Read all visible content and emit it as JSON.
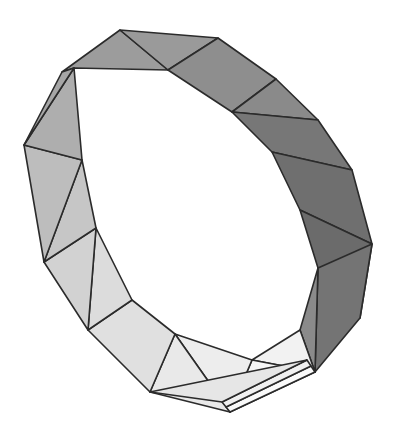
{
  "figure": {
    "name": "triangulated-polygonal-band",
    "description": "Shaded 3D polygonal annulus (Mobius-like band) built from triangular faces",
    "background_color": "#ffffff",
    "edge_color": "#2b2b2b",
    "edge_width": 1.6,
    "canvas": {
      "width": 406,
      "height": 444
    },
    "palette": {
      "dark": "#6f6f6f",
      "mid_dark": "#8c8c8c",
      "mid": "#9c9c9c",
      "mid_light": "#b5b5b5",
      "light": "#d6d6d6",
      "lighter": "#e8e8e8",
      "lightest": "#f4f4f4",
      "white": "#fbfbfb"
    },
    "outer_ring_vertices": [
      [
        120,
        30
      ],
      [
        218,
        38
      ],
      [
        276,
        79
      ],
      [
        318,
        120
      ],
      [
        352,
        170
      ],
      [
        372,
        244
      ],
      [
        360,
        318
      ],
      [
        315,
        372
      ],
      [
        230,
        412
      ],
      [
        150,
        392
      ],
      [
        88,
        330
      ],
      [
        44,
        262
      ],
      [
        24,
        145
      ],
      [
        62,
        72
      ]
    ],
    "inner_ring_vertices": [
      [
        74,
        68
      ],
      [
        168,
        70
      ],
      [
        232,
        112
      ],
      [
        272,
        152
      ],
      [
        300,
        210
      ],
      [
        318,
        268
      ],
      [
        300,
        330
      ],
      [
        252,
        360
      ],
      [
        175,
        334
      ],
      [
        132,
        300
      ],
      [
        96,
        228
      ],
      [
        82,
        160
      ]
    ],
    "faces": [
      {
        "id": "f01",
        "shade": "mid",
        "color": "#9c9c9c",
        "points": "62,72 120,30 168,70 74,68"
      },
      {
        "id": "f02",
        "shade": "mid",
        "color": "#9a9a9a",
        "points": "120,30 218,38 168,70"
      },
      {
        "id": "f03",
        "shade": "mid_dark",
        "color": "#8e8e8e",
        "points": "218,38 276,79 232,112 168,70"
      },
      {
        "id": "f04",
        "shade": "mid_dark",
        "color": "#8a8a8a",
        "points": "276,79 318,120 232,112"
      },
      {
        "id": "f05",
        "shade": "dark",
        "color": "#777777",
        "points": "318,120 352,170 272,152 232,112"
      },
      {
        "id": "f06",
        "shade": "dark",
        "color": "#6f6f6f",
        "points": "352,170 372,244 300,210 272,152"
      },
      {
        "id": "f07",
        "shade": "dark",
        "color": "#6b6b6b",
        "points": "372,244 360,318 318,268 300,210"
      },
      {
        "id": "f08",
        "shade": "dark",
        "color": "#747474",
        "points": "372,244 360,318 315,372 318,268"
      },
      {
        "id": "f09",
        "shade": "mid_dark",
        "color": "#8a8a8a",
        "points": "315,372 318,268 300,330"
      },
      {
        "id": "f10",
        "shade": "lightest",
        "color": "#f2f2f2",
        "points": "315,372 300,330 252,360"
      },
      {
        "id": "f11",
        "shade": "lightest",
        "color": "#f6f6f6",
        "points": "315,372 252,360 230,412"
      },
      {
        "id": "f12",
        "shade": "lighter",
        "color": "#ededed",
        "points": "252,360 230,412 175,334"
      },
      {
        "id": "f13",
        "shade": "lighter",
        "color": "#e9e9e9",
        "points": "230,412 175,334 150,392"
      },
      {
        "id": "f14",
        "shade": "light",
        "color": "#e0e0e0",
        "points": "175,334 150,392 88,330 132,300"
      },
      {
        "id": "f15",
        "shade": "light",
        "color": "#dcdcdc",
        "points": "88,330 132,300 96,228"
      },
      {
        "id": "f16",
        "shade": "mid_light",
        "color": "#d2d2d2",
        "points": "88,330 96,228 44,262"
      },
      {
        "id": "f17",
        "shade": "mid_light",
        "color": "#c6c6c6",
        "points": "44,262 96,228 82,160"
      },
      {
        "id": "f18",
        "shade": "mid_light",
        "color": "#bdbdbd",
        "points": "44,262 82,160 24,145"
      },
      {
        "id": "f19",
        "shade": "mid",
        "color": "#aeaeae",
        "points": "24,145 82,160 74,68"
      },
      {
        "id": "f20",
        "shade": "mid",
        "color": "#a6a6a6",
        "points": "24,145 74,68 62,72"
      }
    ],
    "closure_slivers": [
      {
        "id": "s01",
        "color": "#fafafa",
        "points": "230,412 315,372 311,366 226,407"
      },
      {
        "id": "s02",
        "color": "#f0f0f0",
        "points": "226,407 311,366 307,360 222,402"
      },
      {
        "id": "s03",
        "color": "#e6e6e6",
        "points": "222,402 307,360 150,392"
      }
    ]
  }
}
